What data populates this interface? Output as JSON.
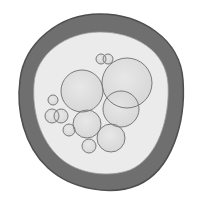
{
  "figure": {
    "colors": {
      "background": "#ffffff",
      "membrane": "#6f6f6f",
      "membrane_edge": "#4e4e4e",
      "cytoplasm": "#ebebeb",
      "vesicle_fill": "#d9d9d9",
      "vesicle_stroke": "#7a7a7a"
    },
    "membrane": {
      "outer_path": "M 100 14 C 140 14 180 38 183 80 C 186 122 172 170 138 185 C 112 196 72 190 48 168 C 24 146 16 110 20 80 C 24 44 58 14 100 14 Z",
      "inner_path": "M 100 32 C 134 32 166 50 168 84 C 170 118 158 158 130 170 C 108 178 78 174 60 158 C 40 140 32 112 34 84 C 36 54 66 32 100 32 Z"
    },
    "vesicles": [
      {
        "cx": 82,
        "cy": 91,
        "r": 21
      },
      {
        "cx": 127,
        "cy": 83,
        "r": 25
      },
      {
        "cx": 121,
        "cy": 109,
        "r": 18
      },
      {
        "cx": 87,
        "cy": 124,
        "r": 14
      },
      {
        "cx": 111,
        "cy": 138,
        "r": 14
      },
      {
        "cx": 89,
        "cy": 146,
        "r": 7
      },
      {
        "cx": 69,
        "cy": 130,
        "r": 6
      },
      {
        "cx": 53,
        "cy": 100,
        "r": 5
      },
      {
        "cx": 52,
        "cy": 116,
        "r": 7
      },
      {
        "cx": 61,
        "cy": 116,
        "r": 7
      },
      {
        "cx": 101,
        "cy": 59,
        "r": 5
      },
      {
        "cx": 108,
        "cy": 59,
        "r": 5
      }
    ]
  }
}
